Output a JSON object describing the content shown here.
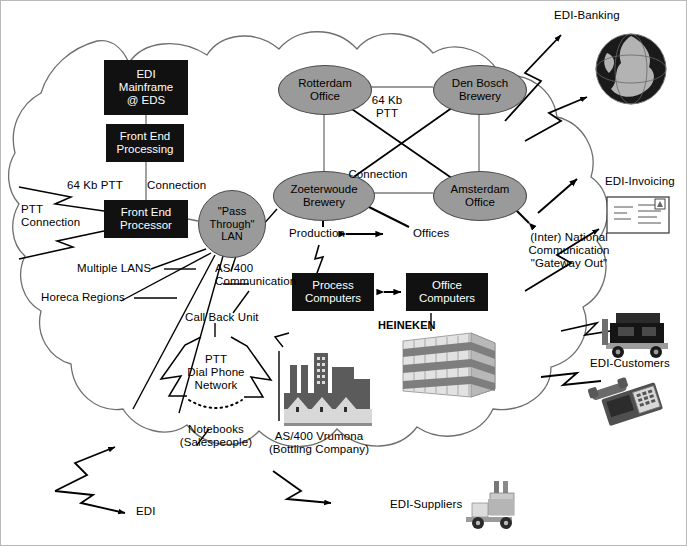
{
  "diagram": {
    "background": "#ffffff",
    "cloud_stroke": "#6e6e6e",
    "node_fill": "#9a9a9a",
    "box_fill": "#111111",
    "box_text": "#ffffff"
  },
  "boxes": [
    {
      "id": "edi-mainframe",
      "label": "EDI\nMainframe\n@ EDS",
      "x": 103,
      "y": 59,
      "w": 84,
      "h": 55
    },
    {
      "id": "front-end-proc",
      "label": "Front End\nProcessing",
      "x": 105,
      "y": 123,
      "w": 78,
      "h": 38
    },
    {
      "id": "front-end-psr",
      "label": "Front End\nProcessor",
      "x": 103,
      "y": 199,
      "w": 84,
      "h": 38
    },
    {
      "id": "process-comp",
      "label": "Process\nComputers",
      "x": 291,
      "y": 272,
      "w": 82,
      "h": 38
    },
    {
      "id": "office-comp",
      "label": "Office\nComputers",
      "x": 405,
      "y": 272,
      "w": 82,
      "h": 38
    }
  ],
  "nodes": [
    {
      "id": "rotterdam",
      "label": "Rotterdam\nOffice",
      "x": 277,
      "y": 64,
      "w": 92,
      "h": 48,
      "shape": "ellipse"
    },
    {
      "id": "denbosch",
      "label": "Den Bosch\nBrewery",
      "x": 432,
      "y": 64,
      "w": 92,
      "h": 48,
      "shape": "ellipse"
    },
    {
      "id": "zoeterwoude",
      "label": "Zoeterwoude\nBrewery",
      "x": 272,
      "y": 170,
      "w": 100,
      "h": 48,
      "shape": "ellipse"
    },
    {
      "id": "amsterdam",
      "label": "Amsterdam\nOffice",
      "x": 432,
      "y": 170,
      "w": 92,
      "h": 48,
      "shape": "ellipse"
    },
    {
      "id": "pass-through-lan",
      "label": "\"Pass\nThrough\"\nLAN",
      "x": 197,
      "y": 189,
      "w": 66,
      "h": 66,
      "shape": "circle"
    }
  ],
  "labels": [
    {
      "id": "64kb-ptt-left",
      "text": "64 Kb PTT",
      "x": 66,
      "y": 178,
      "size": 11.5,
      "align": "left"
    },
    {
      "id": "connection-top",
      "text": "Connection",
      "x": 146,
      "y": 178,
      "size": 11.5,
      "align": "left"
    },
    {
      "id": "ptt-connection",
      "text": "PTT\nConnection",
      "x": 20,
      "y": 202,
      "size": 11.5,
      "align": "left"
    },
    {
      "id": "multiple-lans",
      "text": "Multiple LANS",
      "x": 76,
      "y": 264,
      "size": 11.5,
      "align": "left"
    },
    {
      "id": "horeca-regions",
      "text": "Horeca Regions",
      "x": 40,
      "y": 293,
      "size": 11.5,
      "align": "left"
    },
    {
      "id": "as400-comm",
      "text": "AS/400\nCommunication",
      "x": 214,
      "y": 264,
      "size": 11.5,
      "align": "left"
    },
    {
      "id": "call-back-unit",
      "text": "Call Back Unit",
      "x": 184,
      "y": 313,
      "size": 11.5,
      "align": "left"
    },
    {
      "id": "ptt-dial-phone",
      "text": "PTT\nDial Phone\nNetwork",
      "x": 186,
      "y": 355,
      "size": 11.5,
      "align": "center"
    },
    {
      "id": "notebooks",
      "text": "Notebooks\n(Salespeople)",
      "x": 160,
      "y": 425,
      "size": 11.5,
      "align": "center"
    },
    {
      "id": "64kb-ptt-mid",
      "text": "64 Kb\nPTT",
      "x": 377,
      "y": 96,
      "size": 11.5,
      "align": "center"
    },
    {
      "id": "connection-mid",
      "text": "Connection",
      "x": 371,
      "y": 170,
      "size": 11.5,
      "align": "center"
    },
    {
      "id": "production",
      "text": "Production",
      "x": 290,
      "y": 232,
      "size": 11.5,
      "align": "left"
    },
    {
      "id": "offices",
      "text": "Offices",
      "x": 412,
      "y": 232,
      "size": 11.5,
      "align": "left"
    },
    {
      "id": "heineken",
      "text": "HEINEKEN",
      "x": 377,
      "y": 322,
      "size": 11,
      "align": "left"
    },
    {
      "id": "as400-vrumona",
      "text": "AS/400 Vrumona\n(Bottling Company)",
      "x": 268,
      "y": 432,
      "size": 11.5,
      "align": "center"
    },
    {
      "id": "gateway-out",
      "text": "(Inter) National\nCommunication\n\"Gateway Out\"",
      "x": 521,
      "y": 232,
      "size": 11.5,
      "align": "center"
    },
    {
      "id": "edi-banking",
      "text": "EDI-Banking",
      "x": 553,
      "y": 10,
      "size": 11.5,
      "align": "left"
    },
    {
      "id": "edi-invoicing",
      "text": "EDI-Invoicing",
      "x": 604,
      "y": 176,
      "size": 11.5,
      "align": "left"
    },
    {
      "id": "edi-customers",
      "text": "EDI-Customers",
      "x": 589,
      "y": 358,
      "size": 11.5,
      "align": "left"
    },
    {
      "id": "edi-suppliers",
      "text": "EDI-Suppliers",
      "x": 389,
      "y": 501,
      "size": 11.5,
      "align": "left"
    },
    {
      "id": "edi",
      "text": "EDI",
      "x": 135,
      "y": 508,
      "size": 11.5,
      "align": "left"
    }
  ],
  "icons": [
    {
      "id": "globe-icon",
      "name": "globe-icon",
      "x": 594,
      "y": 32,
      "w": 72,
      "h": 72
    },
    {
      "id": "envelope-icon",
      "name": "envelope-icon",
      "x": 606,
      "y": 192,
      "w": 62,
      "h": 42
    },
    {
      "id": "truck-icon",
      "name": "truck-icon",
      "x": 595,
      "y": 308,
      "w": 78,
      "h": 48
    },
    {
      "id": "telephone-icon",
      "name": "telephone-icon",
      "x": 592,
      "y": 374,
      "w": 74,
      "h": 50
    },
    {
      "id": "forklift-icon",
      "name": "forklift-icon",
      "x": 463,
      "y": 478,
      "w": 60,
      "h": 52
    },
    {
      "id": "factory-icon",
      "name": "factory-icon",
      "x": 283,
      "y": 348,
      "w": 88,
      "h": 78
    },
    {
      "id": "building-icon",
      "name": "office-building-icon",
      "x": 398,
      "y": 330,
      "w": 100,
      "h": 72
    }
  ]
}
